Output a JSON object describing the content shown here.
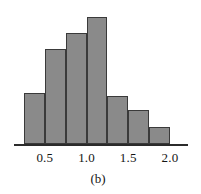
{
  "figure": {
    "caption": "(b)",
    "background_color": "#ffffff"
  },
  "chart_data": {
    "type": "bar",
    "title": "",
    "subtitle": "",
    "xlabel": "",
    "ylabel": "",
    "caption": "(b)",
    "orientation": "vertical",
    "grid": false,
    "legend": null,
    "legend_position": "none",
    "bar_fill_color": "#8a8a8a",
    "bar_edge_color": "#3a3a3a",
    "axis_color": "#2b2b2b",
    "axis_visible": {
      "x": true,
      "y": false
    },
    "xlim": [
      0.14,
      2.38
    ],
    "ylim": [
      0,
      135
    ],
    "yaxis_visible": false,
    "bin_width": 0.25,
    "bin_edges": [
      0.25,
      0.5,
      0.75,
      1.0,
      1.25,
      1.5,
      1.75,
      2.0
    ],
    "categories": [
      "0.25-0.50",
      "0.50-0.75",
      "0.75-1.00",
      "1.00-1.25",
      "1.25-1.50",
      "1.50-1.75",
      "1.75-2.00"
    ],
    "bin_centers": [
      0.375,
      0.625,
      0.875,
      1.125,
      1.375,
      1.625,
      1.875
    ],
    "values": [
      51,
      95,
      111,
      127,
      48,
      34,
      17
    ],
    "xticks": [
      0.5,
      1.0,
      1.5,
      2.0
    ],
    "xticklabels": [
      "0.5",
      "1.0",
      "1.5",
      "2.0"
    ],
    "yticks": [],
    "yticklabels": []
  }
}
